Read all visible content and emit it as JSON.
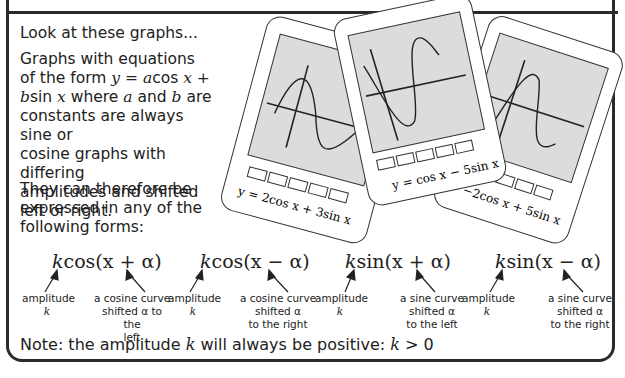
{
  "intro": "Look at these graphs...",
  "paragraph1": {
    "line1": "Graphs with equations",
    "line2_pre": "of the form ",
    "line2_eq": "y = a",
    "line2_cos": "cos ",
    "line2_x": "x +",
    "line3_b": "b",
    "line3_sin": "sin ",
    "line3_x": "x",
    "line3_rest": " where ",
    "line3_a": "a",
    "line3_and": " and ",
    "line3_b2": "b",
    "line3_are": " are",
    "line4": "constants are always sine or",
    "line5": "cosine graphs with differing",
    "line6": "amplitudes and shifted",
    "line7": "left or right."
  },
  "paragraph2": {
    "line1": "They can therefore be",
    "line2": "expressed in any of the",
    "line3": "following forms:"
  },
  "calculators": [
    {
      "caption": "y = 2cos x + 3sin x"
    },
    {
      "caption": "y = cos x − 5sin x"
    },
    {
      "caption": "y = −2cos x + 5sin x"
    }
  ],
  "forms": [
    {
      "k": "k",
      "expr": "cos(x + α)",
      "amp_label": "amplitude",
      "amp_var": "k",
      "shift_l1": "a cosine curve",
      "shift_l2": "shifted α to the",
      "shift_l3": "left"
    },
    {
      "k": "k",
      "expr": "cos(x − α)",
      "amp_label": "amplitude",
      "amp_var": "k",
      "shift_l1": "a cosine curve",
      "shift_l2": "shifted α",
      "shift_l3": "to the right"
    },
    {
      "k": "k",
      "expr": "sin(x + α)",
      "amp_label": "amplitude",
      "amp_var": "k",
      "shift_l1": "a sine curve",
      "shift_l2": "shifted α",
      "shift_l3": "to the left"
    },
    {
      "k": "k",
      "expr": "sin(x − α)",
      "amp_label": "amplitude",
      "amp_var": "k",
      "shift_l1": "a sine curve",
      "shift_l2": "shifted α",
      "shift_l3": "to the right"
    }
  ],
  "note": {
    "pre": "Note: the amplitude ",
    "k": "k",
    "mid": " will always be positive: ",
    "k2": "k",
    "post": " > 0"
  },
  "colors": {
    "screen": "#dcdcdc",
    "border": "#2a2a2a"
  }
}
